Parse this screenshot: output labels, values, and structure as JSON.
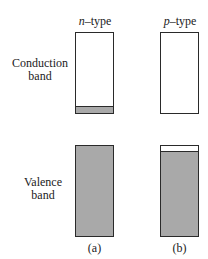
{
  "column_headers": {
    "n": {
      "prefix": "n",
      "suffix": "–type"
    },
    "p": {
      "prefix": "p",
      "suffix": "–type"
    }
  },
  "row_labels": {
    "conduction": [
      "Conduction",
      "band"
    ],
    "valence": [
      "Valence",
      "band"
    ]
  },
  "captions": {
    "a": "(a)",
    "b": "(b)"
  },
  "colors": {
    "filled": "#a9a9a9",
    "empty": "#ffffff",
    "border": "#2a2a2a"
  }
}
